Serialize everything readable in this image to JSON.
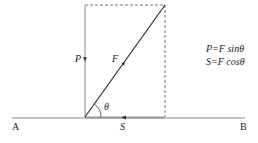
{
  "diagram": {
    "labels": {
      "A": "A",
      "B": "B",
      "P": "P",
      "F": "F",
      "S": "S",
      "theta": "θ"
    },
    "formulas": {
      "line1": "P=F sinθ",
      "line2": "S=F cosθ"
    },
    "colors": {
      "line": "#333333",
      "baseline": "#888888",
      "s_segment": "#999999"
    }
  }
}
